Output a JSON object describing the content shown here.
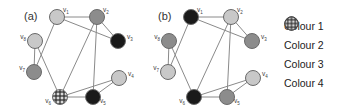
{
  "colors": {
    "colour1": "#c8c8c8",
    "colour2": "#8c8c8c",
    "colour3": "#1a1a1a",
    "colour4": "checkered",
    "edge": "#8a8a8a"
  },
  "graphs": [
    {
      "label": "(a)",
      "offset_x": 0,
      "nodes": [
        {
          "id": "v1",
          "sub": "1",
          "x": 57,
          "y": 17,
          "colour": "colour1"
        },
        {
          "id": "v2",
          "sub": "2",
          "x": 97,
          "y": 17,
          "colour": "colour2"
        },
        {
          "id": "v3",
          "sub": "3",
          "x": 118,
          "y": 41,
          "colour": "colour3"
        },
        {
          "id": "v4",
          "sub": "4",
          "x": 119,
          "y": 78,
          "colour": "colour1"
        },
        {
          "id": "v5",
          "sub": "5",
          "x": 93,
          "y": 97,
          "colour": "colour3"
        },
        {
          "id": "v6",
          "sub": "6",
          "x": 60,
          "y": 97,
          "colour": "colour4"
        },
        {
          "id": "v7",
          "sub": "7",
          "x": 34,
          "y": 72,
          "colour": "colour2"
        },
        {
          "id": "v8",
          "sub": "8",
          "x": 35,
          "y": 41,
          "colour": "colour1"
        }
      ]
    },
    {
      "label": "(b)",
      "offset_x": 134,
      "nodes": [
        {
          "id": "v1",
          "sub": "1",
          "x": 57,
          "y": 17,
          "colour": "colour3"
        },
        {
          "id": "v2",
          "sub": "2",
          "x": 97,
          "y": 17,
          "colour": "colour1"
        },
        {
          "id": "v3",
          "sub": "3",
          "x": 118,
          "y": 41,
          "colour": "colour2"
        },
        {
          "id": "v4",
          "sub": "4",
          "x": 119,
          "y": 78,
          "colour": "colour1"
        },
        {
          "id": "v5",
          "sub": "5",
          "x": 93,
          "y": 97,
          "colour": "colour2"
        },
        {
          "id": "v6",
          "sub": "6",
          "x": 60,
          "y": 97,
          "colour": "colour3"
        },
        {
          "id": "v7",
          "sub": "7",
          "x": 34,
          "y": 72,
          "colour": "colour1"
        },
        {
          "id": "v8",
          "sub": "8",
          "x": 35,
          "y": 41,
          "colour": "colour2"
        }
      ]
    }
  ],
  "edges": [
    [
      "v1",
      "v2"
    ],
    [
      "v1",
      "v3"
    ],
    [
      "v2",
      "v3"
    ],
    [
      "v1",
      "v7"
    ],
    [
      "v8",
      "v7"
    ],
    [
      "v8",
      "v6"
    ],
    [
      "v2",
      "v6"
    ],
    [
      "v2",
      "v5"
    ],
    [
      "v6",
      "v5"
    ],
    [
      "v6",
      "v4"
    ],
    [
      "v5",
      "v4"
    ]
  ],
  "legend": [
    {
      "label": "Colour 1",
      "colour": "colour1"
    },
    {
      "label": "Colour 2",
      "colour": "colour2"
    },
    {
      "label": "Colour 3",
      "colour": "colour3"
    },
    {
      "label": "Colour 4",
      "colour": "colour4"
    }
  ]
}
